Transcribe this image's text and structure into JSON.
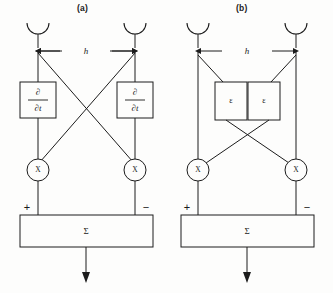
{
  "figure": {
    "title": "",
    "background_color": "#fdfdfc",
    "line_color": "#1c1c1c",
    "width": 333,
    "height": 293
  },
  "panels": [
    {
      "id": "a",
      "label": "(a)",
      "sensors": [
        {
          "name": "left-sensor",
          "type": "cup-antenna"
        },
        {
          "name": "right-sensor",
          "type": "cup-antenna"
        }
      ],
      "spacing_label": "h",
      "processing_boxes": [
        {
          "name": "left-derivative-box",
          "numerator": "∂",
          "denominator": "∂t"
        },
        {
          "name": "right-derivative-box",
          "numerator": "∂",
          "denominator": "∂t"
        }
      ],
      "multipliers": [
        {
          "name": "left-multiplier",
          "symbol": "X"
        },
        {
          "name": "right-multiplier",
          "symbol": "X"
        }
      ],
      "summation": {
        "symbol": "Σ",
        "left_sign": "+",
        "right_sign": "−"
      },
      "output": {
        "name": "output-arrow",
        "direction": "down"
      }
    },
    {
      "id": "b",
      "label": "(b)",
      "sensors": [
        {
          "name": "left-sensor",
          "type": "cup-antenna"
        },
        {
          "name": "right-sensor",
          "type": "cup-antenna"
        }
      ],
      "spacing_label": "h",
      "processing_boxes": [
        {
          "name": "left-epsilon-box",
          "symbol": "ε"
        },
        {
          "name": "right-epsilon-box",
          "symbol": "ε"
        }
      ],
      "multipliers": [
        {
          "name": "left-multiplier",
          "symbol": "X"
        },
        {
          "name": "right-multiplier",
          "symbol": "X"
        }
      ],
      "summation": {
        "symbol": "Σ",
        "left_sign": "+",
        "right_sign": "−"
      },
      "output": {
        "name": "output-arrow",
        "direction": "down"
      }
    }
  ]
}
